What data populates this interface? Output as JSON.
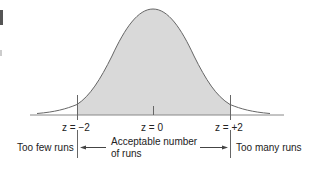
{
  "diagram": {
    "type": "normal-distribution-runs-test",
    "z_labels": {
      "left": "z = −2",
      "center": "z = 0",
      "right": "z = +2"
    },
    "regions": {
      "left": "Too few runs",
      "middle_line1": "Acceptable number",
      "middle_line2": "of runs",
      "right": "Too many runs"
    },
    "colors": {
      "shade": "#d9d9d9",
      "curve": "#666666",
      "axis": "#888888",
      "text": "#222222"
    }
  }
}
